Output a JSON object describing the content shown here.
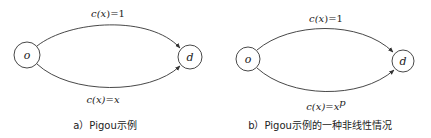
{
  "diagrams": [
    {
      "id": "a",
      "nodes": [
        {
          "label": "o",
          "cx": 27,
          "cy": 55,
          "r": 13
        },
        {
          "label": "d",
          "cx": 190,
          "cy": 57,
          "r": 12
        }
      ],
      "edges": [
        {
          "from": "o",
          "to": "d",
          "cost_fn": "c(x)=1",
          "cost_prefix": "c(",
          "cost_var": "x",
          "cost_suffix": ")=1",
          "position": "top"
        },
        {
          "from": "o",
          "to": "d",
          "cost_fn": "c(x)=x",
          "cost_prefix": "c(",
          "cost_var": "x",
          "cost_suffix": ")=x",
          "position": "bottom"
        }
      ],
      "caption": "a）Pigou示例"
    },
    {
      "id": "b",
      "nodes": [
        {
          "label": "o",
          "cx": 248,
          "cy": 59,
          "r": 12
        },
        {
          "label": "d",
          "cx": 403,
          "cy": 61,
          "r": 11
        }
      ],
      "edges": [
        {
          "from": "o",
          "to": "d",
          "cost_fn": "c(x)=1",
          "cost_prefix": "c(",
          "cost_var": "x",
          "cost_suffix": ")=1",
          "position": "top"
        },
        {
          "from": "o",
          "to": "d",
          "cost_fn": "c(x)=x^p",
          "cost_prefix": "c(",
          "cost_var": "x",
          "cost_suffix": ")=x",
          "cost_exp": "p",
          "position": "bottom"
        }
      ],
      "caption": "b）Pigou示例的一种非线性情况"
    }
  ],
  "colors": {
    "stroke": "#333333",
    "text": "#222222",
    "background": "#ffffff"
  }
}
